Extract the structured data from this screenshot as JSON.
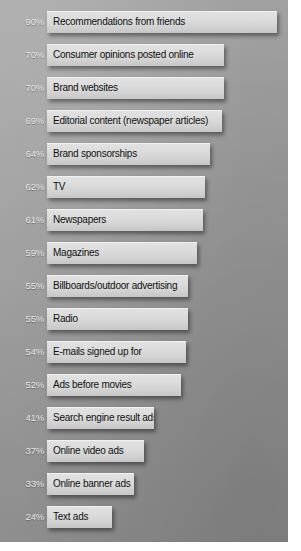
{
  "chart_data": {
    "type": "bar",
    "orientation": "horizontal",
    "title": "",
    "subtitle": "",
    "xlabel": "",
    "ylabel": "",
    "xlim": [
      0,
      100
    ],
    "grid": false,
    "legend": null,
    "value_suffix": "%",
    "categories": [
      "Recommendations from friends",
      "Consumer opinions posted online",
      "Brand websites",
      "Editorial content (newspaper articles)",
      "Brand sponsorships",
      "TV",
      "Newspapers",
      "Magazines",
      "Billboards/outdoor advertising",
      "Radio",
      "E-mails signed up for",
      "Ads before movies",
      "Search engine result ads",
      "Online video ads",
      "Online banner ads",
      "Text ads"
    ],
    "values": [
      90,
      70,
      70,
      69,
      64,
      62,
      61,
      59,
      55,
      55,
      54,
      52,
      41,
      37,
      33,
      24
    ],
    "value_labels": [
      "90%",
      "70%",
      "70%",
      "69%",
      "64%",
      "62%",
      "61%",
      "59%",
      "55%",
      "55%",
      "54%",
      "52%",
      "41%",
      "37%",
      "33%",
      "24%"
    ],
    "colors": {
      "background": "#989898",
      "bar_fill": "#dcdcdc",
      "bar_text": "#111111",
      "value_label": "#e6e6e6"
    }
  },
  "bars": [
    {
      "label": "Recommendations from friends",
      "value_label": "90%",
      "value": 90,
      "top": 11,
      "width": 230
    },
    {
      "label": "Consumer opinions posted online",
      "value_label": "70%",
      "value": 70,
      "top": 44,
      "width": 177
    },
    {
      "label": "Brand websites",
      "value_label": "70%",
      "value": 70,
      "top": 77,
      "width": 177
    },
    {
      "label": "Editorial content (newspaper articles)",
      "value_label": "69%",
      "value": 69,
      "top": 110,
      "width": 175
    },
    {
      "label": "Brand sponsorships",
      "value_label": "64%",
      "value": 64,
      "top": 143,
      "width": 163
    },
    {
      "label": "TV",
      "value_label": "62%",
      "value": 62,
      "top": 176,
      "width": 158
    },
    {
      "label": "Newspapers",
      "value_label": "61%",
      "value": 61,
      "top": 209,
      "width": 156
    },
    {
      "label": "Magazines",
      "value_label": "59%",
      "value": 59,
      "top": 242,
      "width": 150
    },
    {
      "label": "Billboards/outdoor advertising",
      "value_label": "55%",
      "value": 55,
      "top": 275,
      "width": 141
    },
    {
      "label": "Radio",
      "value_label": "55%",
      "value": 55,
      "top": 308,
      "width": 141
    },
    {
      "label": "E-mails signed up for",
      "value_label": "54%",
      "value": 54,
      "top": 341,
      "width": 139
    },
    {
      "label": "Ads before movies",
      "value_label": "52%",
      "value": 52,
      "top": 374,
      "width": 134
    },
    {
      "label": "Search engine result ads",
      "value_label": "41%",
      "value": 41,
      "top": 407,
      "width": 107
    },
    {
      "label": "Online video ads",
      "value_label": "37%",
      "value": 37,
      "top": 440,
      "width": 97
    },
    {
      "label": "Online banner ads",
      "value_label": "33%",
      "value": 33,
      "top": 473,
      "width": 87
    },
    {
      "label": "Text ads",
      "value_label": "24%",
      "value": 24,
      "top": 506,
      "width": 65
    }
  ]
}
